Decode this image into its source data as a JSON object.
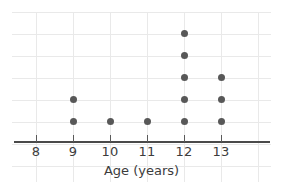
{
  "chart_data": {
    "type": "scatter",
    "plot_style": "dot-plot",
    "title": "",
    "xlabel": "Age (years)",
    "ylabel": "",
    "categories": [
      8,
      9,
      10,
      11,
      12,
      13
    ],
    "tick_labels": [
      "8",
      "9",
      "10",
      "11",
      "12",
      "13"
    ],
    "values": [
      0,
      2,
      1,
      1,
      5,
      3
    ],
    "counts": {
      "8": 0,
      "9": 2,
      "10": 1,
      "11": 1,
      "12": 5,
      "13": 3
    },
    "total_points": 12,
    "xlim": [
      7.5,
      13.5
    ],
    "ylim": [
      0,
      6
    ],
    "grid": true,
    "legend": null,
    "dot_color": "#585858",
    "grid_color": "#e9e9e9",
    "axis_color": "#4a4a4a",
    "text_color": "#3c3c3c",
    "points": [
      {
        "x": 9,
        "stack": 1
      },
      {
        "x": 9,
        "stack": 2
      },
      {
        "x": 10,
        "stack": 1
      },
      {
        "x": 11,
        "stack": 1
      },
      {
        "x": 12,
        "stack": 1
      },
      {
        "x": 12,
        "stack": 2
      },
      {
        "x": 12,
        "stack": 3
      },
      {
        "x": 12,
        "stack": 4
      },
      {
        "x": 12,
        "stack": 5
      },
      {
        "x": 13,
        "stack": 1
      },
      {
        "x": 13,
        "stack": 2
      },
      {
        "x": 13,
        "stack": 3
      }
    ]
  },
  "axis": {
    "x_title": "Age (years)"
  }
}
